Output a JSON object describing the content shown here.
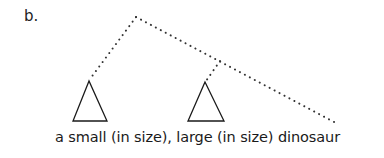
{
  "example_label": "b.",
  "tree": {
    "branch_style": "dotted",
    "constituents": [
      {
        "id": "left-triangle",
        "covers": "a small (in size),"
      },
      {
        "id": "middle-triangle",
        "covers": "large (in size)"
      },
      {
        "id": "right-leaf",
        "covers": "dinosaur"
      }
    ]
  },
  "sentence": "a small (in size), large (in size) dinosaur",
  "colors": {
    "line": "#1a1a1a",
    "dots": "#333333",
    "background": "#ffffff"
  }
}
